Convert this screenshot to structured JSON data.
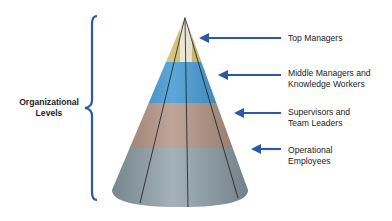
{
  "diagram": {
    "title": "Organizational Levels",
    "side_label": {
      "line1": "Organizational",
      "line2": "Levels"
    },
    "levels": [
      {
        "line1": "Top Managers",
        "line2": "",
        "color": "#c9b65a"
      },
      {
        "line1": "Middle Managers and",
        "line2": "Knowledge Workers",
        "color": "#2f8fce"
      },
      {
        "line1": "Supervisors and",
        "line2": "Team Leaders",
        "color": "#ae8c7c"
      },
      {
        "line1": "Operational",
        "line2": "Employees",
        "color": "#8a9ca6"
      }
    ],
    "arrow_color": "#2a5aa5",
    "brace_color": "#2a5aa5"
  }
}
